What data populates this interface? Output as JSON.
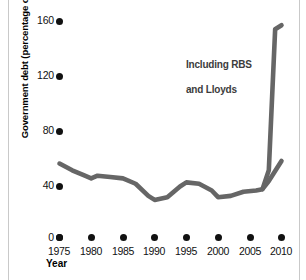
{
  "chart_data": {
    "type": "line",
    "title": "",
    "xlabel": "Year",
    "ylabel": "Government debt (percentage of GDP)",
    "xlim": [
      1975,
      2010
    ],
    "ylim": [
      0,
      160
    ],
    "grid": false,
    "legend_position": "none",
    "xticks": [
      "1975",
      "1980",
      "1985",
      "1990",
      "1995",
      "2000",
      "2005",
      "2010"
    ],
    "yticks": [
      "0",
      "40",
      "80",
      "120",
      "160"
    ],
    "line_color": "#666666",
    "annotations": [
      {
        "text": "Including RBS\nand Lloyds",
        "x": 2006,
        "y": 130
      }
    ],
    "series": [
      {
        "name": "Government debt (excluding RBS and Lloyds)",
        "x": [
          1975,
          1977,
          1979,
          1980,
          1981,
          1983,
          1985,
          1987,
          1989,
          1990,
          1992,
          1994,
          1995,
          1997,
          1999,
          2000,
          2002,
          2004,
          2006,
          2007,
          2008,
          2010
        ],
        "values": [
          55,
          50,
          46,
          44,
          46,
          45,
          44,
          40,
          31,
          28,
          30,
          38,
          41,
          40,
          35,
          30,
          31,
          34,
          35,
          36,
          42,
          57
        ]
      },
      {
        "name": "Government debt (including RBS and Lloyds)",
        "x": [
          2007,
          2008,
          2009,
          2010
        ],
        "values": [
          36,
          50,
          155,
          158
        ]
      }
    ]
  },
  "axes": {
    "y_title": "Government debt (percentage of GDP)",
    "x_title": "Year",
    "y_tick_labels": [
      "160",
      "120",
      "80",
      "40",
      "0"
    ],
    "x_tick_labels": [
      "1975",
      "1980",
      "1985",
      "1990",
      "1995",
      "2000",
      "2005",
      "2010"
    ]
  },
  "annotation": {
    "line1": "Including RBS",
    "line2": "and Lloyds"
  }
}
